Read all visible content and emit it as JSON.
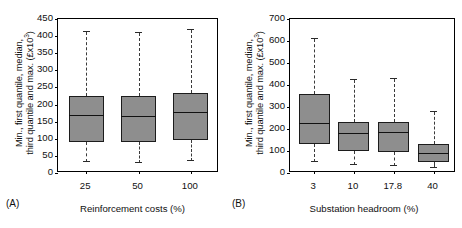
{
  "chart_data": [
    {
      "type": "box",
      "panel_label": "(A)",
      "title": "",
      "xlabel": "Reinforcement costs (%)",
      "ylabel": "Min., first quantile, median, third quantile and max. (£x10³)",
      "ylabel_line1": "Min., first quantile, median,",
      "ylabel_line2": "third quantile and max. (£x10",
      "ylabel_exp": "3",
      "ylabel_tail": ")",
      "categories": [
        "25",
        "50",
        "100"
      ],
      "ylim": [
        0,
        450
      ],
      "ytick_step": 50,
      "yticks": [
        "450",
        "400",
        "350",
        "300",
        "250",
        "200",
        "150",
        "100",
        "50",
        "0"
      ],
      "grid": false,
      "legend": "none",
      "boxes": [
        {
          "category": "25",
          "min": 25,
          "q1": 85,
          "median": 162,
          "q3": 218,
          "max": 405
        },
        {
          "category": "50",
          "min": 22,
          "q1": 86,
          "median": 159,
          "q3": 220,
          "max": 402
        },
        {
          "category": "100",
          "min": 30,
          "q1": 90,
          "median": 169,
          "q3": 227,
          "max": 412
        }
      ]
    },
    {
      "type": "box",
      "panel_label": "(B)",
      "title": "",
      "xlabel": "Substation headroom (%)",
      "ylabel": "Min., first quantile, median, third quantile and max. (£x10³)",
      "ylabel_line1": "Min., first quantile, median,",
      "ylabel_line2": "third quantile and max. (£x10",
      "ylabel_exp": "3",
      "ylabel_tail": ")",
      "categories": [
        "3",
        "10",
        "17.8",
        "40"
      ],
      "ylim": [
        0,
        700
      ],
      "ytick_step": 100,
      "yticks": [
        "700",
        "600",
        "500",
        "400",
        "300",
        "200",
        "100",
        "0"
      ],
      "grid": false,
      "legend": "none",
      "boxes": [
        {
          "category": "3",
          "min": 40,
          "q1": 124,
          "median": 213,
          "q3": 352,
          "max": 601
        },
        {
          "category": "10",
          "min": 28,
          "q1": 90,
          "median": 169,
          "q3": 225,
          "max": 415
        },
        {
          "category": "17.8",
          "min": 22,
          "q1": 88,
          "median": 174,
          "q3": 225,
          "max": 420
        },
        {
          "category": "40",
          "min": 15,
          "q1": 42,
          "median": 79,
          "q3": 125,
          "max": 268
        }
      ]
    }
  ],
  "style": {
    "box_fill": "#8e8e8e",
    "box_stroke": "#1c1c1c",
    "median_color": "#111111",
    "whisker_color": "#3a3a3a",
    "axis_color": "#000000",
    "background": "#ffffff"
  }
}
